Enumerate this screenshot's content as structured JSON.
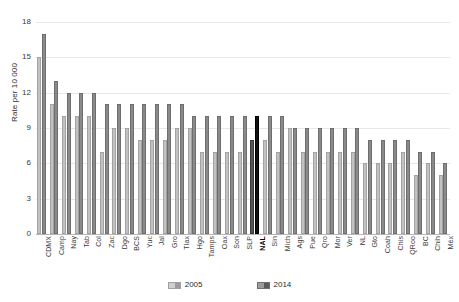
{
  "chart_data": {
    "type": "bar",
    "title": "",
    "subtitle": "",
    "xlabel": "",
    "ylabel": "Rate per 10 000",
    "ylim": [
      0,
      18
    ],
    "yticks": [
      0,
      3,
      6,
      9,
      12,
      15,
      18
    ],
    "ytick_labels": [
      "0",
      "3",
      "6",
      "9",
      "12",
      "15",
      "18"
    ],
    "grid": true,
    "legend_position": "bottom",
    "highlight_category": "NAL",
    "categories": [
      "CDMX",
      "Camp",
      "Nay",
      "Tab",
      "Col",
      "Zac",
      "Dgo",
      "BCS",
      "Yuc",
      "Jal",
      "Gro",
      "Tlax",
      "Hgo",
      "Tamps",
      "Oax",
      "Son",
      "SLP",
      "NAL",
      "Sin",
      "Mich",
      "Ags",
      "Pue",
      "Qro",
      "Mor",
      "Ver",
      "NL",
      "Gto",
      "Coah",
      "Chis",
      "QRoo",
      "BC",
      "Chih",
      "Méx"
    ],
    "series": [
      {
        "name": "2005",
        "color": "#c2c2c2",
        "values": [
          15.0,
          11.0,
          10.0,
          10.0,
          10.0,
          7.0,
          9.0,
          9.0,
          8.0,
          8.0,
          8.0,
          9.0,
          9.0,
          7.0,
          7.0,
          7.0,
          7.0,
          8.0,
          8.0,
          7.0,
          9.0,
          7.0,
          7.0,
          7.0,
          7.0,
          7.0,
          6.0,
          6.0,
          6.0,
          7.0,
          5.0,
          6.0,
          5.0
        ]
      },
      {
        "name": "2014",
        "color": "#8a8a8a",
        "values": [
          17.0,
          13.0,
          12.0,
          12.0,
          12.0,
          11.0,
          11.0,
          11.0,
          11.0,
          11.0,
          11.0,
          11.0,
          10.0,
          10.0,
          10.0,
          10.0,
          10.0,
          10.0,
          10.0,
          10.0,
          9.0,
          9.0,
          9.0,
          9.0,
          9.0,
          9.0,
          8.0,
          8.0,
          8.0,
          8.0,
          7.0,
          7.0,
          6.0
        ]
      }
    ]
  },
  "legend": {
    "items": [
      {
        "label": "2005",
        "swatch": "legend-swatch-2005"
      },
      {
        "label": "2014",
        "swatch": "legend-swatch-2014"
      }
    ]
  }
}
